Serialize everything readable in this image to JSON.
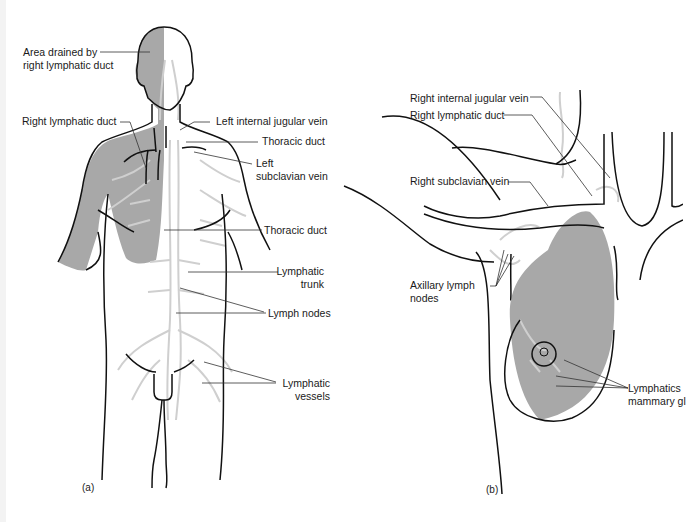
{
  "figure": {
    "panel_a": {
      "tag": "(a)",
      "labels": {
        "area_drained_line1": "Area drained by",
        "area_drained_line2": "right lymphatic duct",
        "right_lymphatic_duct": "Right lymphatic duct",
        "left_internal_jugular_vein": "Left internal jugular vein",
        "thoracic_duct_upper": "Thoracic duct",
        "left_subclavian_line1": "Left",
        "left_subclavian_line2": "subclavian vein",
        "thoracic_duct_lower": "Thoracic duct",
        "lymphatic_trunk_line1": "Lymphatic",
        "lymphatic_trunk_line2": "trunk",
        "lymph_nodes": "Lymph nodes",
        "lymphatic_vessels_line1": "Lymphatic",
        "lymphatic_vessels_line2": "vessels"
      }
    },
    "panel_b": {
      "tag": "(b)",
      "labels": {
        "right_internal_jugular_vein": "Right internal jugular vein",
        "right_lymphatic_duct": "Right lymphatic duct",
        "right_subclavian_vein": "Right subclavian vein",
        "axillary_line1": "Axillary lymph",
        "axillary_line2": "nodes",
        "mammary_line1": "Lymphatics",
        "mammary_line2": "mammary gl"
      }
    },
    "colors": {
      "shading": "#a8a8a8",
      "lymph": "#cfcfcf",
      "outline": "#111111",
      "leader": "#333333"
    }
  }
}
